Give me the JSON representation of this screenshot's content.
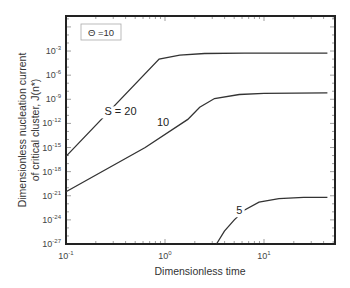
{
  "chart_data": {
    "type": "line",
    "title": "",
    "xlabel": "Dimensionless time",
    "ylabel_lines": [
      "Dimensionless nucleation current",
      "of critical cluster, J(n*)"
    ],
    "xscale": "log",
    "yscale": "log",
    "xlim": [
      0.1,
      50
    ],
    "ylim": [
      1e-27,
      10
    ],
    "x_ticks": [
      {
        "base": "10",
        "exp": "-1",
        "value": 0.1
      },
      {
        "base": "10",
        "exp": "0",
        "value": 1
      },
      {
        "base": "10",
        "exp": "1",
        "value": 10
      }
    ],
    "y_ticks": [
      {
        "base": "10",
        "exp": "-3",
        "log": -3
      },
      {
        "base": "10",
        "exp": "-6",
        "log": -6
      },
      {
        "base": "10",
        "exp": "-9",
        "log": -9
      },
      {
        "base": "10",
        "exp": "-12",
        "log": -12
      },
      {
        "base": "10",
        "exp": "-15",
        "log": -15
      },
      {
        "base": "10",
        "exp": "-18",
        "log": -18
      },
      {
        "base": "10",
        "exp": "-21",
        "log": -21
      },
      {
        "base": "10",
        "exp": "-24",
        "log": -24
      },
      {
        "base": "10",
        "exp": "-27",
        "log": -27
      }
    ],
    "grid": false,
    "legend": {
      "text": "Θ =10",
      "position": "top-left"
    },
    "series": [
      {
        "name": "S = 20",
        "label": "S = 20",
        "label_pos_log": [
          -0.45,
          -11.0
        ],
        "points_log10": [
          [
            -1,
            -16.1
          ],
          [
            -0.06,
            -4.0
          ],
          [
            0.15,
            -3.5
          ],
          [
            0.4,
            -3.3
          ],
          [
            0.8,
            -3.25
          ],
          [
            1.64,
            -3.25
          ]
        ]
      },
      {
        "name": "S = 10",
        "label": "10",
        "label_pos_log": [
          -0.02,
          -12.3
        ],
        "points_log10": [
          [
            -1,
            -20.5
          ],
          [
            -0.2,
            -15.0
          ],
          [
            0.23,
            -11.5
          ],
          [
            0.35,
            -10.0
          ],
          [
            0.5,
            -8.9
          ],
          [
            0.75,
            -8.4
          ],
          [
            1.0,
            -8.25
          ],
          [
            1.64,
            -8.2
          ]
        ]
      },
      {
        "name": "S = 5",
        "label": "5",
        "label_pos_log": [
          0.75,
          -23.3
        ],
        "points_log10": [
          [
            0.52,
            -27
          ],
          [
            0.6,
            -25.4
          ],
          [
            0.7,
            -24.0
          ],
          [
            0.8,
            -22.8
          ],
          [
            0.95,
            -21.8
          ],
          [
            1.15,
            -21.35
          ],
          [
            1.4,
            -21.2
          ],
          [
            1.64,
            -21.2
          ]
        ]
      }
    ]
  }
}
